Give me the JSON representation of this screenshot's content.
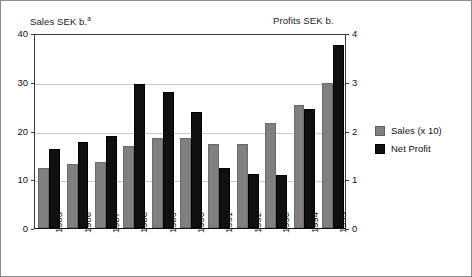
{
  "chart_data": {
    "type": "bar",
    "title": "",
    "categories": [
      "1985",
      "1986",
      "1987",
      "1988",
      "1989",
      "1990",
      "1991",
      "1992",
      "1993",
      "1994",
      "1995"
    ],
    "series": [
      {
        "name": "Sales (x 10)",
        "axis": "left",
        "color": "#808080",
        "values": [
          12.3,
          13.2,
          13.5,
          16.8,
          18.5,
          18.4,
          17.3,
          17.2,
          21.6,
          25.2,
          29.7
        ]
      },
      {
        "name": "Net Profit",
        "axis": "right",
        "color": "#101010",
        "values": [
          1.63,
          1.76,
          1.88,
          2.96,
          2.79,
          2.38,
          1.23,
          1.11,
          1.08,
          2.45,
          3.76
        ]
      }
    ],
    "left_axis": {
      "label": "Sales SEK b.",
      "label_superscript": "a",
      "ticks": [
        "0",
        "10",
        "20",
        "30",
        "40"
      ],
      "tick_values": [
        0,
        10,
        20,
        30,
        40
      ],
      "ylim": [
        0,
        40
      ]
    },
    "right_axis": {
      "label": "Profits SEK b.",
      "ticks": [
        "0",
        "1",
        "2",
        "3",
        "4"
      ],
      "tick_values": [
        0,
        1,
        2,
        3,
        4
      ],
      "ylim": [
        0,
        4
      ]
    },
    "xlabel": "",
    "grid": true,
    "legend_position": "right",
    "legend": [
      {
        "label": "Sales (x 10)",
        "swatch": "sales"
      },
      {
        "label": "Net Profit",
        "swatch": "profit"
      }
    ]
  }
}
